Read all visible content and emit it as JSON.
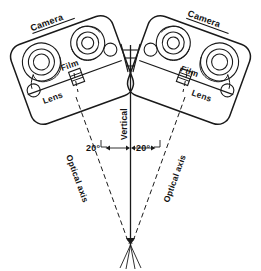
{
  "diagram": {
    "type": "optical-schematic",
    "background_color": "#ffffff",
    "ink_color": "#1a1a1a"
  },
  "labels": {
    "camera_left": "Camera",
    "camera_right": "Camera",
    "film_left": "Film",
    "film_right": "Film",
    "lens_left": "Lens",
    "lens_right": "Lens",
    "vertical": "Vertical",
    "optical_axis_left": "Optical axis",
    "optical_axis_right": "Optical axis",
    "angle_left": "20°",
    "angle_right": "20°"
  },
  "geometry": {
    "convergence_point": {
      "x": 130,
      "y": 245
    },
    "vertical_axis_x": 130,
    "vertical_axis_top": 45,
    "vertical_axis_bottom": 245,
    "tilt_degrees": 20,
    "left_lens": {
      "x": 76,
      "y": 97
    },
    "right_lens": {
      "x": 185,
      "y": 97
    },
    "angle_arc_y": 148
  },
  "parts": {
    "spool_count_per_camera": 2,
    "roller_count_per_camera": 1,
    "lens_shape": "small-rectangle-on-film-plane",
    "wedge": "field-of-view-wedge-between-cameras"
  }
}
